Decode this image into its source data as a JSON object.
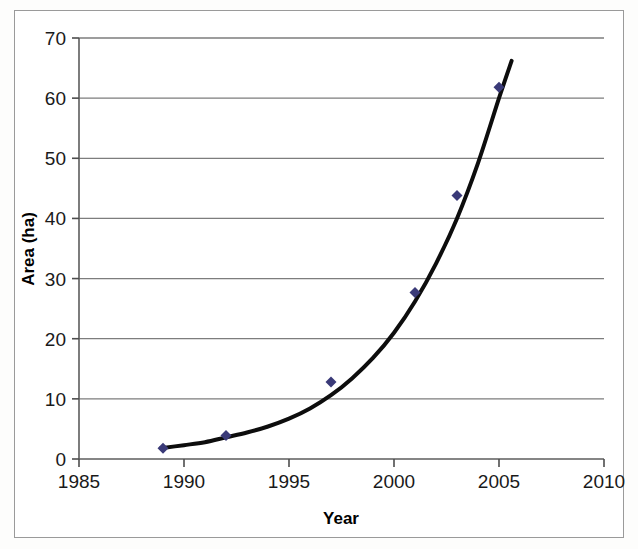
{
  "figure": {
    "background_color": "#ffffff",
    "frame_color": "#9a9a9a"
  },
  "chart_data": {
    "type": "scatter",
    "title": "",
    "subtitle": "",
    "xlabel": "Year",
    "ylabel": "Area (ha)",
    "xlim": [
      1985,
      2010
    ],
    "ylim": [
      0,
      70
    ],
    "xticks": [
      1985,
      1990,
      1995,
      2000,
      2005,
      2010
    ],
    "xtick_labels": [
      "1985",
      "1990",
      "1995",
      "2000",
      "2005",
      "2010"
    ],
    "yticks": [
      0,
      10,
      20,
      30,
      40,
      50,
      60,
      70
    ],
    "ytick_labels": [
      "0",
      "10",
      "20",
      "30",
      "40",
      "50",
      "60",
      "70"
    ],
    "grid": {
      "horizontal": true,
      "vertical": false,
      "color": "#7d7d7d"
    },
    "legend": {
      "visible": false,
      "position": "none",
      "entries": []
    },
    "marker": {
      "shape": "diamond",
      "color": "#3a3a78",
      "size": 11
    },
    "series": [
      {
        "name": "Area",
        "x": [
          1989,
          1992,
          1997,
          2001,
          2003,
          2005
        ],
        "values": [
          1.8,
          3.9,
          12.8,
          27.7,
          43.8,
          61.8
        ]
      }
    ],
    "trendline": {
      "name": "exponential fit",
      "type": "exponential",
      "color": "#0d0d0d",
      "width": 4,
      "x_start": 1988.9,
      "x_end": 2005.6,
      "y_start": 1.8,
      "y_end": 66.2,
      "points": [
        [
          1988.9,
          1.8
        ],
        [
          1990.0,
          2.3
        ],
        [
          1991.0,
          2.8
        ],
        [
          1992.0,
          3.6
        ],
        [
          1993.0,
          4.4
        ],
        [
          1994.0,
          5.4
        ],
        [
          1995.0,
          6.7
        ],
        [
          1996.0,
          8.4
        ],
        [
          1997.0,
          10.6
        ],
        [
          1998.0,
          13.4
        ],
        [
          1999.0,
          16.8
        ],
        [
          2000.0,
          21.0
        ],
        [
          2001.0,
          26.2
        ],
        [
          2002.0,
          32.5
        ],
        [
          2003.0,
          40.0
        ],
        [
          2004.0,
          49.2
        ],
        [
          2005.0,
          60.0
        ],
        [
          2005.6,
          66.2
        ]
      ]
    },
    "annotations": []
  }
}
